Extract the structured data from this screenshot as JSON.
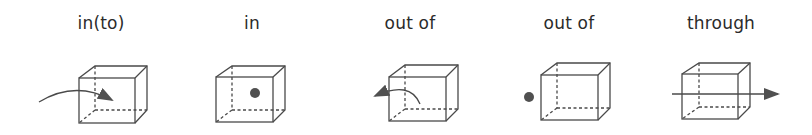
{
  "diagram": {
    "title": "",
    "colors": {
      "line": "#4a4a4a",
      "fill": "#505050",
      "text": "#2b2b2b",
      "background": "#ffffff"
    },
    "panels": [
      {
        "label": "in(to)",
        "label_x": 101,
        "depiction": "curved arrow entering the cube from outside left, arrowhead inside the cube"
      },
      {
        "label": "in",
        "label_x": 252,
        "depiction": "dot located inside the cube"
      },
      {
        "label": "out of",
        "label_x": 410,
        "depiction": "curved arrow exiting the cube from inside toward the left, arrowhead outside"
      },
      {
        "label": "out of",
        "label_x": 569,
        "depiction": "dot located outside the cube to its left"
      },
      {
        "label": "through",
        "label_x": 721,
        "depiction": "straight arrow passing horizontally through the cube, arrowhead on the right"
      }
    ]
  }
}
